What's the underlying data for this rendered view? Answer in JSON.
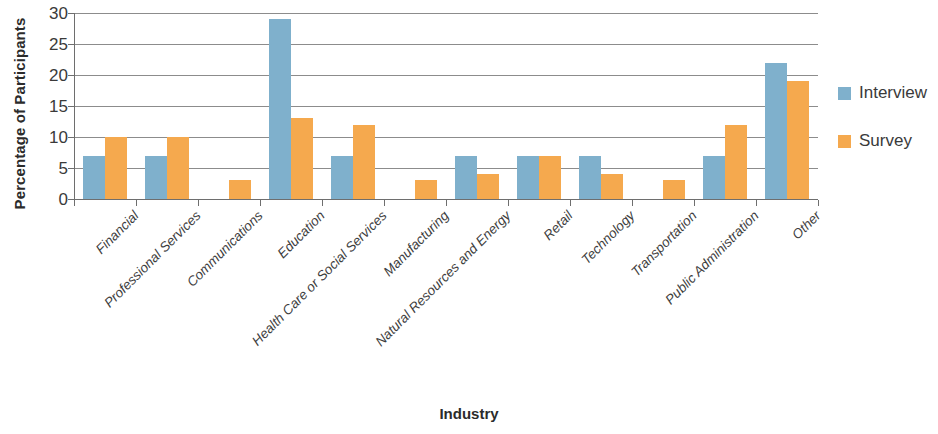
{
  "chart_data": {
    "type": "bar",
    "title": "",
    "xlabel": "Industry",
    "ylabel": "Percentage of Participants",
    "ylim": [
      0,
      30
    ],
    "ytick_step": 5,
    "yticks": [
      0,
      5,
      10,
      15,
      20,
      25,
      30
    ],
    "grid": true,
    "legend_position": "right",
    "categories": [
      "Financial",
      "Professional Services",
      "Communications",
      "Education",
      "Health Care or Social Services",
      "Manufacturing",
      "Natural Resources and Energy",
      "Retail",
      "Technology",
      "Transportation",
      "Public Administration",
      "Other"
    ],
    "series": [
      {
        "name": "Interview",
        "color": "#7FB0CC",
        "values": [
          7,
          7,
          0,
          29,
          7,
          0,
          7,
          7,
          7,
          0,
          7,
          22
        ]
      },
      {
        "name": "Survey",
        "color": "#F5A94E",
        "values": [
          10,
          10,
          3,
          13,
          12,
          3,
          4,
          7,
          4,
          3,
          12,
          19
        ]
      }
    ]
  },
  "legend": {
    "items": [
      {
        "label": "Interview",
        "color": "#7FB0CC",
        "swatch": "legend-swatch-interview"
      },
      {
        "label": "Survey",
        "color": "#F5A94E",
        "swatch": "legend-swatch-survey"
      }
    ]
  }
}
